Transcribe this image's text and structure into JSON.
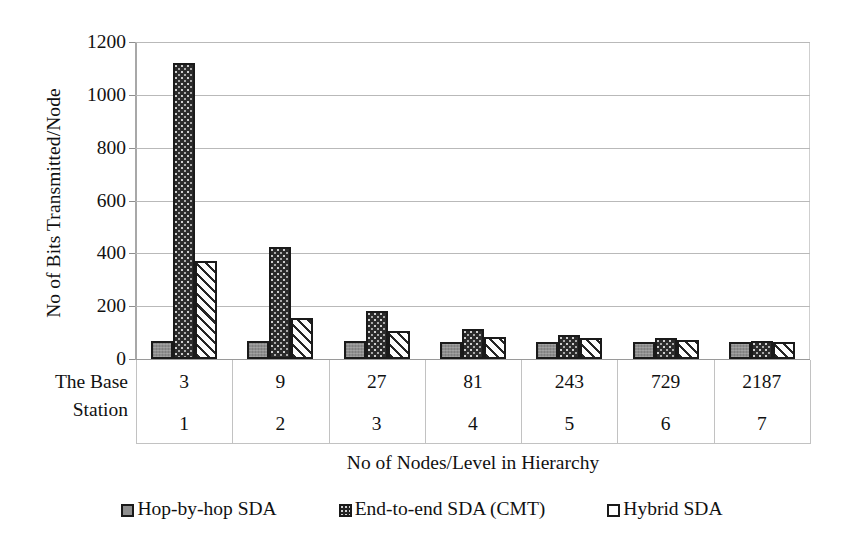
{
  "chart_data": {
    "type": "bar",
    "title": "",
    "xlabel": "No of Nodes/Level in Hierarchy",
    "ylabel": "No of Bits Transmitted/Node",
    "ylim": [
      0,
      1200
    ],
    "yticks": [
      0,
      200,
      400,
      600,
      800,
      1000,
      1200
    ],
    "grid": true,
    "legend_position": "bottom",
    "categories": [
      "3",
      "9",
      "27",
      "81",
      "243",
      "729",
      "2187"
    ],
    "levels": [
      "1",
      "2",
      "3",
      "4",
      "5",
      "6",
      "7"
    ],
    "axis_row_label": "The Base Station",
    "axis_row_label_line1": "The Base",
    "axis_row_label_line2": "Station",
    "series": [
      {
        "name": "Hop-by-hop SDA",
        "values": [
          68,
          68,
          68,
          65,
          63,
          63,
          63
        ]
      },
      {
        "name": "End-to-end SDA (CMT)",
        "values": [
          1120,
          425,
          180,
          112,
          90,
          80,
          70
        ]
      },
      {
        "name": "Hybrid SDA",
        "values": [
          372,
          155,
          105,
          85,
          80,
          72,
          66
        ]
      }
    ]
  },
  "legend": {
    "items": [
      {
        "label": "Hop-by-hop SDA",
        "swatch": "gray-solid-swatch"
      },
      {
        "label": "End-to-end SDA (CMT)",
        "swatch": "dark-stipple-swatch"
      },
      {
        "label": "Hybrid SDA",
        "swatch": "white-hatch-swatch"
      }
    ]
  },
  "colors": {
    "series_hop_by_hop": "#8e8e8e",
    "series_end_to_end": "#2b2b2b",
    "series_hybrid": "#fdfdfd",
    "bar_outline": "#1a1a1a",
    "gridline": "#b9b9b9",
    "text": "#111111",
    "background": "#ffffff"
  }
}
